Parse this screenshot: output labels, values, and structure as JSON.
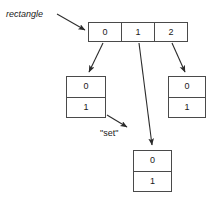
{
  "diagram": {
    "type": "pointer-structure-diagram",
    "background_color": "#ffffff",
    "stroke_color": "#4a4a4a",
    "text_color": "#1a1a1a",
    "labels": {
      "rectangle": "rectangle",
      "set": "\"set\""
    },
    "nodes": {
      "array": {
        "name": "array-node",
        "orientation": "horizontal",
        "cells": [
          "0",
          "1",
          "2"
        ]
      },
      "left_child": {
        "name": "left-child-node",
        "orientation": "vertical",
        "cells": [
          "0",
          "1"
        ]
      },
      "right_child": {
        "name": "right-child-node",
        "orientation": "vertical",
        "cells": [
          "0",
          "1"
        ]
      },
      "bottom_child": {
        "name": "bottom-child-node",
        "orientation": "vertical",
        "cells": [
          "0",
          "1"
        ]
      }
    },
    "edges": [
      {
        "from": "rectangle-label",
        "to": "array-node",
        "arrow": true
      },
      {
        "from": "array-cell-0",
        "to": "left-child-node",
        "arrow": true
      },
      {
        "from": "array-cell-1",
        "to": "bottom-child-node",
        "arrow": true
      },
      {
        "from": "array-cell-2",
        "to": "right-child-node",
        "arrow": true
      },
      {
        "from": "left-child-node",
        "to": "set-label",
        "arrow": true
      }
    ]
  }
}
